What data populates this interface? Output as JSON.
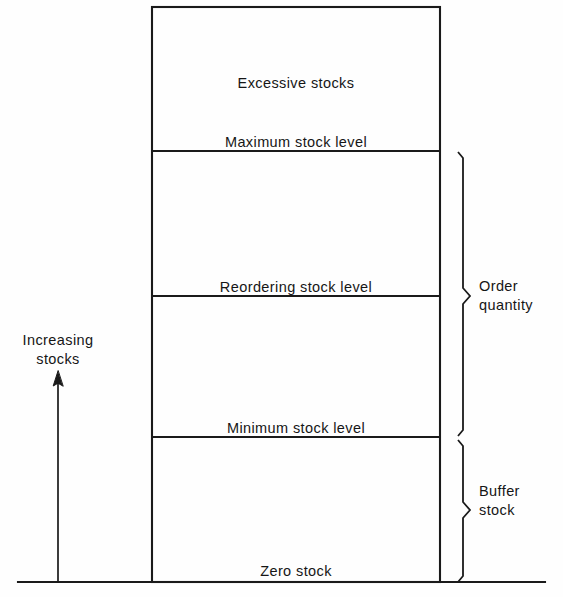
{
  "diagram": {
    "bands": [
      {
        "name": "excessive-stocks",
        "label": "Excessive stocks"
      },
      {
        "name": "maximum-stock",
        "label": "Maximum stock level"
      },
      {
        "name": "reordering-stock",
        "label": "Reordering stock level"
      },
      {
        "name": "minimum-stock",
        "label": "Minimum stock level"
      },
      {
        "name": "zero-stock",
        "label": "Zero stock"
      }
    ],
    "axis": {
      "label_line1": "Increasing",
      "label_line2": "stocks",
      "direction": "up"
    },
    "brackets": [
      {
        "name": "order-quantity",
        "label_line1": "Order",
        "label_line2": "quantity"
      },
      {
        "name": "buffer-stock",
        "label_line1": "Buffer",
        "label_line2": "stock"
      }
    ],
    "colors": {
      "stroke": "#1a1a1a",
      "background": "#fefefe",
      "text": "#161616"
    }
  }
}
